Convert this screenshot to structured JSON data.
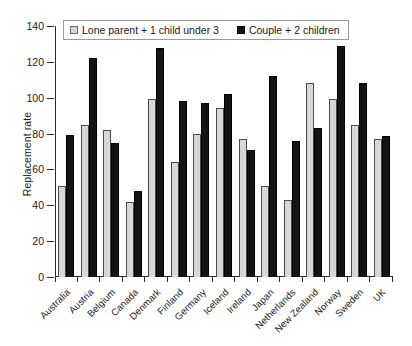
{
  "chart_data": {
    "type": "bar",
    "title": "",
    "xlabel": "",
    "ylabel": "Replacement rate",
    "ylim": [
      0,
      140
    ],
    "ytick_step": 20,
    "yticks": [
      0,
      20,
      40,
      60,
      80,
      100,
      120,
      140
    ],
    "grid": false,
    "legend_position": "top-left-inside",
    "categories": [
      "Australia",
      "Austria",
      "Belgium",
      "Canada",
      "Denmark",
      "Finland",
      "Germany",
      "Iceland",
      "Ireland",
      "Japan",
      "Netherlands",
      "New Zealand",
      "Norway",
      "Sweden",
      "UK"
    ],
    "series": [
      {
        "name": "Lone parent + 1 child under 3",
        "color": "#d7d7d7",
        "values": [
          51,
          85,
          82,
          42,
          99.5,
          64,
          80,
          94,
          77,
          51,
          43,
          108,
          99.5,
          85,
          77
        ]
      },
      {
        "name": "Couple + 2 children",
        "color": "#141414",
        "values": [
          79,
          122,
          75,
          48,
          128,
          98,
          97,
          102,
          71,
          112,
          76,
          83,
          129,
          108,
          78.5
        ]
      }
    ]
  }
}
